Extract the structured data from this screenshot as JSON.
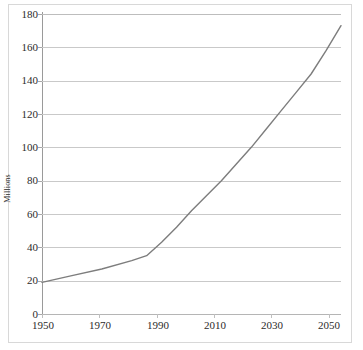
{
  "chart_data": {
    "type": "line",
    "title": "",
    "subtitle": "",
    "xlabel": "",
    "ylabel": "Millions",
    "xlim": [
      1950,
      2050
    ],
    "ylim": [
      0,
      180
    ],
    "y_ticks": [
      0,
      20,
      40,
      60,
      80,
      100,
      120,
      140,
      160,
      180
    ],
    "x_ticks": [
      1950,
      1970,
      1990,
      2010,
      2030,
      2050
    ],
    "x_tick_labels": [
      "1950",
      "1970",
      "1990",
      "2010",
      "2030",
      "2050"
    ],
    "y_tick_labels": [
      "0",
      "20",
      "40",
      "60",
      "80",
      "100",
      "120",
      "140",
      "160",
      "180"
    ],
    "grid": "horizontal",
    "legend": "none",
    "series": [
      {
        "name": "Population",
        "color": "#7d7d7d",
        "x": [
          1950,
          1960,
          1970,
          1980,
          1985,
          1990,
          1995,
          2000,
          2005,
          2010,
          2015,
          2020,
          2025,
          2030,
          2035,
          2040,
          2045,
          2050
        ],
        "values": [
          19,
          23,
          27,
          32,
          35,
          43,
          52,
          62,
          71,
          80,
          90,
          100,
          111,
          122,
          133,
          144,
          158,
          173
        ]
      }
    ],
    "annotations": []
  },
  "axis": {
    "y_title": "Millions"
  },
  "colors": {
    "line": "#7d7d7d",
    "gridline": "#c9c9c9",
    "axis": "#9a9a9a",
    "frame": "#d8d8d8",
    "text": "#2b2b2b",
    "background": "#ffffff"
  }
}
